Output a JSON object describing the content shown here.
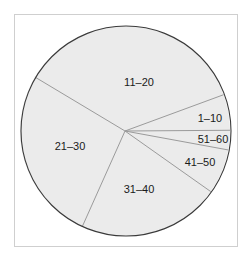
{
  "chart_data": {
    "type": "pie",
    "title": "",
    "categories": [
      "1–10",
      "51–60",
      "41–50",
      "31–40",
      "21–30",
      "11–20"
    ],
    "values": [
      5.5,
      3.0,
      6.9,
      21.9,
      26.9,
      35.8
    ],
    "units": "percent (estimated from slice angles)",
    "start_angle_deg": -20.2,
    "direction": "clockwise",
    "legend": "none (labels inside slices)",
    "grid": false,
    "slice_fill": "#ebebeb",
    "divider_color": "#9a9a9a",
    "outline_color": "#3a3a3a"
  },
  "labels": {
    "s1_10": "1–10",
    "s51_60": "51–60",
    "s41_50": "41–50",
    "s31_40": "31–40",
    "s21_30": "21–30",
    "s11_20": "11–20"
  }
}
